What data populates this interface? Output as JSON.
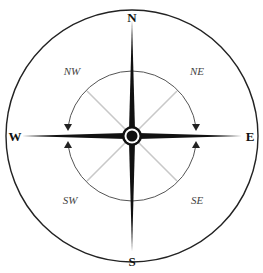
{
  "diagram": {
    "type": "compass-rose",
    "cardinal": {
      "north": "N",
      "east": "E",
      "south": "S",
      "west": "W"
    },
    "intercardinal": {
      "northwest": "NW",
      "northeast": "NE",
      "southwest": "SW",
      "southeast": "SE"
    },
    "colors": {
      "needle": "#111111",
      "diagonal": "#c8c8c8",
      "arc": "#555555",
      "outline": "#222222"
    }
  }
}
